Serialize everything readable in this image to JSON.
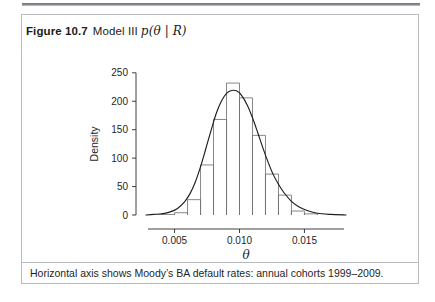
{
  "figure": {
    "number_label": "Figure 10.7",
    "title_text": "Model III",
    "title_math": "p(θ | R)",
    "caption": "Horizontal axis shows Moody’s BA default rates: annual cohorts 1999–2009."
  },
  "chart_data": {
    "type": "bar",
    "xlabel": "θ",
    "ylabel": "Density",
    "xlim": [
      0.0028,
      0.0182
    ],
    "ylim": [
      0,
      262
    ],
    "grid": false,
    "legend": null,
    "x_tick_labels": [
      "0.005",
      "0.010",
      "0.015"
    ],
    "x_tick_values": [
      0.005,
      0.01,
      0.015
    ],
    "y_tick_labels": [
      "0",
      "50",
      "100",
      "150",
      "200",
      "250"
    ],
    "y_tick_values": [
      0,
      50,
      100,
      150,
      200,
      250
    ],
    "bin_width": 0.001,
    "bin_edges": [
      0.004,
      0.005,
      0.006,
      0.007,
      0.008,
      0.009,
      0.01,
      0.011,
      0.012,
      0.013,
      0.014,
      0.015,
      0.016
    ],
    "categories": [
      "0.0045",
      "0.0055",
      "0.0065",
      "0.0075",
      "0.0085",
      "0.0095",
      "0.0105",
      "0.0115",
      "0.0125",
      "0.0135",
      "0.0145",
      "0.0155"
    ],
    "values": [
      1,
      4,
      27,
      88,
      168,
      232,
      206,
      140,
      72,
      35,
      7,
      2
    ],
    "series": [
      {
        "name": "Posterior histogram",
        "values": [
          1,
          4,
          27,
          88,
          168,
          232,
          206,
          140,
          72,
          35,
          7,
          2
        ]
      },
      {
        "name": "Smoothed density",
        "type": "line",
        "x": [
          0.0028,
          0.0034,
          0.004,
          0.0046,
          0.0052,
          0.0058,
          0.0062,
          0.0066,
          0.007,
          0.0074,
          0.0078,
          0.0082,
          0.0086,
          0.009,
          0.0094,
          0.0098,
          0.0102,
          0.0106,
          0.011,
          0.0114,
          0.0118,
          0.0122,
          0.0126,
          0.013,
          0.0134,
          0.014,
          0.0146,
          0.0152,
          0.016,
          0.017,
          0.0182
        ],
        "y": [
          0,
          1,
          2,
          5,
          11,
          24,
          38,
          58,
          85,
          116,
          148,
          178,
          200,
          214,
          219,
          218,
          209,
          193,
          171,
          145,
          118,
          93,
          71,
          54,
          40,
          24,
          14,
          8,
          3,
          1,
          0
        ]
      }
    ]
  }
}
